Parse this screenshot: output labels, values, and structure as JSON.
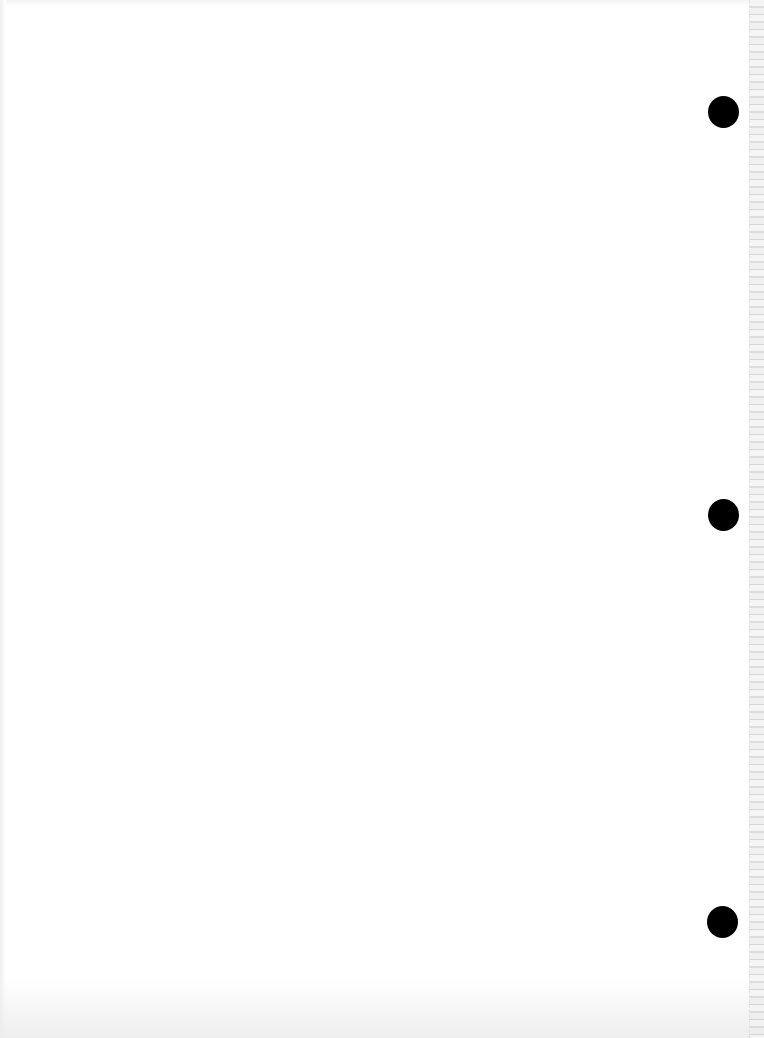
{
  "document": {
    "type": "blank scanned page",
    "background_color": "#ffffff",
    "text": "",
    "punch_holes": [
      {
        "center_x": 723,
        "center_y": 111,
        "diameter": 31,
        "color": "#000000"
      },
      {
        "center_x": 723,
        "center_y": 514,
        "diameter": 31,
        "color": "#000000"
      },
      {
        "center_x": 722,
        "center_y": 921,
        "diameter": 31,
        "color": "#000000"
      }
    ],
    "right_edge": "perforated/torn gray strip"
  }
}
